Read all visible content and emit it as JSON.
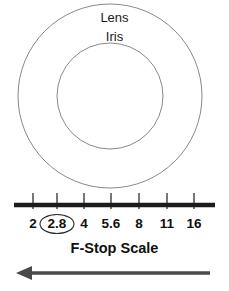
{
  "figure": {
    "title": "F-Stop Scale",
    "width": 229,
    "height": 291,
    "background_color": "#ffffff"
  },
  "lens_diagram": {
    "outer_label": "Lens",
    "inner_label": "Iris",
    "outer_circle": {
      "cx": 110,
      "cy": 96,
      "r": 92,
      "stroke_color": "#7a7a7a",
      "fill": "none"
    },
    "inner_circle": {
      "cx": 110,
      "cy": 96,
      "r": 53,
      "stroke_color": "#7a7a7a",
      "fill": "none"
    }
  },
  "chart_data": {
    "type": "scale",
    "title": "F-Stop Scale",
    "xlabel": "F-Stop Scale",
    "ylabel": "",
    "orientation": "horizontal",
    "axis_color": "#1c1c1c",
    "tick_color": "#4a4a4a",
    "highlight_value": "2.8",
    "categories": [
      "2",
      "2.8",
      "4",
      "5.6",
      "8",
      "11",
      "16"
    ],
    "values": [
      2,
      2.8,
      4,
      5.6,
      8,
      11,
      16
    ],
    "tick_positions_px": [
      33,
      57,
      84,
      111,
      139,
      167,
      194
    ],
    "axis_start_px": 14,
    "axis_end_px": 215,
    "axis_y_px": 205,
    "grid": false,
    "legend": false,
    "annotations": [
      {
        "text": "2.8",
        "shape": "ellipse",
        "note": "circled / highlighted f-stop",
        "cx": 57,
        "cy": 224,
        "rx": 17,
        "ry": 9.5,
        "stroke_color": "#2b2b2b"
      }
    ]
  },
  "direction_arrow": {
    "name": "aperture-direction-arrow",
    "label": "",
    "direction": "left",
    "color": "#4a4a4a",
    "start_x": 210,
    "end_x": 16,
    "y": 273
  }
}
